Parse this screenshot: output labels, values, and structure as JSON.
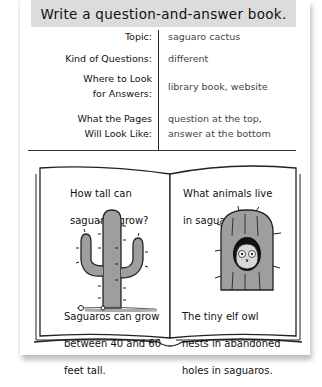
{
  "banner": {
    "title": "Write a question-and-answer book."
  },
  "plan": {
    "rows": [
      {
        "label": "Topic:",
        "value": "saguaro cactus"
      },
      {
        "label": "Kind of Questions:",
        "value": "different"
      },
      {
        "label": "Where to Look\nfor Answers:",
        "label_line1": "Where to Look",
        "label_line2": "for Answers:",
        "value": "library book, website"
      },
      {
        "label": "What the Pages\nWill Look Like:",
        "label_line1": "What the Pages",
        "label_line2": "Will Look Like:",
        "value_line1": "question at the top,",
        "value_line2": "answer at the bottom"
      }
    ]
  },
  "book": {
    "left_page": {
      "question_line1": "How tall can",
      "question_line2": "saguaros grow?",
      "illustration": "saguaro-cactus-illustration",
      "answer_line1": "Saguaros can grow",
      "answer_line2": "between 40 and 60",
      "answer_line3": "feet tall."
    },
    "right_page": {
      "question_line1": "What animals live",
      "question_line2": "in saguaros?",
      "illustration": "elf-owl-in-saguaro-illustration",
      "answer_line1": "The tiny elf owl",
      "answer_line2": "nests in abandoned",
      "answer_line3": "holes in saguaros."
    }
  },
  "colors": {
    "banner_bg": "#dcdcdc",
    "cactus_fill": "#9e9e9e",
    "ink": "#1a1a1a"
  }
}
